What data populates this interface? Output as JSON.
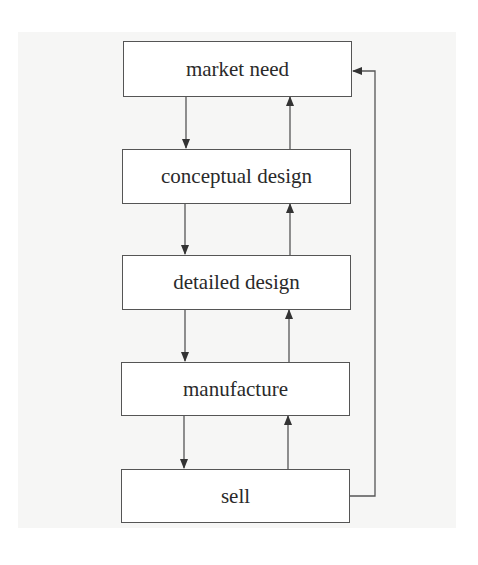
{
  "diagram": {
    "type": "flowchart",
    "colors": {
      "background": "#ffffff",
      "panel": "#f6f6f5",
      "stroke": "#555555",
      "text": "#2a2a2a",
      "box_fill": "#ffffff"
    },
    "nodes": [
      {
        "id": "market-need",
        "label": "market need"
      },
      {
        "id": "conceptual-design",
        "label": "conceptual design"
      },
      {
        "id": "detailed-design",
        "label": "detailed design"
      },
      {
        "id": "manufacture",
        "label": "manufacture"
      },
      {
        "id": "sell",
        "label": "sell"
      }
    ],
    "edges": [
      {
        "from": "market-need",
        "to": "conceptual-design",
        "direction": "down"
      },
      {
        "from": "conceptual-design",
        "to": "market-need",
        "direction": "up"
      },
      {
        "from": "conceptual-design",
        "to": "detailed-design",
        "direction": "down"
      },
      {
        "from": "detailed-design",
        "to": "conceptual-design",
        "direction": "up"
      },
      {
        "from": "detailed-design",
        "to": "manufacture",
        "direction": "down"
      },
      {
        "from": "manufacture",
        "to": "detailed-design",
        "direction": "up"
      },
      {
        "from": "manufacture",
        "to": "sell",
        "direction": "down"
      },
      {
        "from": "sell",
        "to": "manufacture",
        "direction": "up"
      },
      {
        "from": "sell",
        "to": "market-need",
        "direction": "feedback-loop-right"
      }
    ]
  }
}
